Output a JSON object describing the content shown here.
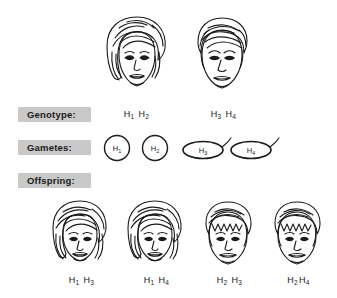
{
  "figure": {
    "background_color": "#ffffff",
    "ink_color": "#1a1a1a",
    "label_box_color": "#c9c9c9"
  },
  "row_labels": [
    {
      "name": "genotype",
      "text": "Genotype:"
    },
    {
      "name": "gametes",
      "text": "Gametes:"
    },
    {
      "name": "offspring",
      "text": "Offspring:"
    }
  ],
  "parents": [
    {
      "name": "mother",
      "sex": "female",
      "hair": "long-wavy",
      "alleles": [
        "H",
        "1",
        "H",
        "2"
      ],
      "genotype_parts": {
        "a_letter": "H",
        "a_sub": "1",
        "b_letter": "H",
        "b_sub": "2"
      },
      "center_x": 137
    },
    {
      "name": "father",
      "sex": "male",
      "hair": "short",
      "alleles": [
        "H",
        "3",
        "H",
        "4"
      ],
      "genotype_parts": {
        "a_letter": "H",
        "a_sub": "3",
        "b_letter": "H",
        "b_sub": "4"
      },
      "center_x": 222
    }
  ],
  "gametes": {
    "eggs": [
      {
        "name": "egg-h1",
        "shape": "circle",
        "letter": "H",
        "sub": "1",
        "center_x": 117
      },
      {
        "name": "egg-h2",
        "shape": "circle",
        "letter": "H",
        "sub": "2",
        "center_x": 155
      }
    ],
    "sperm": [
      {
        "name": "sperm-h3",
        "shape": "ellipse-with-tail",
        "letter": "H",
        "sub": "3",
        "center_x": 208
      },
      {
        "name": "sperm-h4",
        "shape": "ellipse-with-tail",
        "letter": "H",
        "sub": "4",
        "center_x": 256
      }
    ]
  },
  "offspring": [
    {
      "name": "offspring-1",
      "sex": "female",
      "hair": "long-wavy",
      "genotype_parts": {
        "a_letter": "H",
        "a_sub": "1",
        "b_letter": "H",
        "b_sub": "3"
      },
      "center_x": 80,
      "spaced": true
    },
    {
      "name": "offspring-2",
      "sex": "female",
      "hair": "long-wavy",
      "genotype_parts": {
        "a_letter": "H",
        "a_sub": "1",
        "b_letter": "H",
        "b_sub": "4"
      },
      "center_x": 155,
      "spaced": true
    },
    {
      "name": "offspring-3",
      "sex": "male",
      "hair": "short",
      "genotype_parts": {
        "a_letter": "H",
        "a_sub": "2",
        "b_letter": "H",
        "b_sub": "3"
      },
      "center_x": 228,
      "spaced": true
    },
    {
      "name": "offspring-4",
      "sex": "male",
      "hair": "short",
      "genotype_parts": {
        "a_letter": "H",
        "a_sub": "2",
        "b_letter": "H",
        "b_sub": "4"
      },
      "center_x": 297,
      "spaced": false
    }
  ]
}
